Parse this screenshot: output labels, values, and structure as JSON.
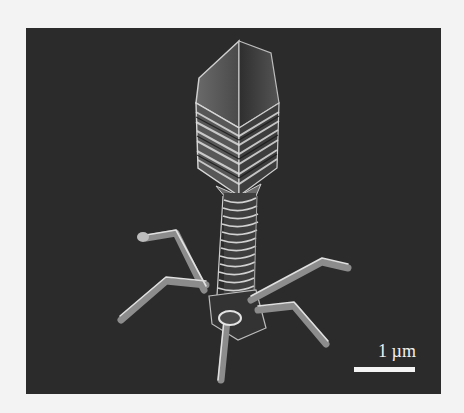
{
  "figure": {
    "kind": "scanning electron micrograph",
    "colors": {
      "page_background": "#f3f3f3",
      "image_background": "#2b2b2b",
      "highlight": "#e6e6e6"
    },
    "scale_bar": {
      "label": "1 µm"
    }
  }
}
